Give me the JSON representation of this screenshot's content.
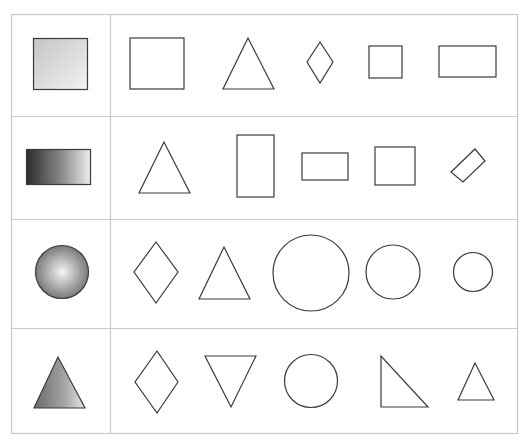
{
  "puzzle": {
    "colors": {
      "grid": "#c8c8c8",
      "stroke": "#333333"
    },
    "rows": [
      {
        "sample": "gradient-square",
        "options": [
          "square",
          "triangle",
          "diamond",
          "small-square",
          "rectangle"
        ]
      },
      {
        "sample": "gradient-rectangle",
        "options": [
          "triangle",
          "tall-rectangle",
          "wide-rectangle",
          "square",
          "rotated-rectangle"
        ]
      },
      {
        "sample": "gradient-circle",
        "options": [
          "diamond",
          "triangle",
          "large-circle",
          "medium-circle",
          "small-circle"
        ]
      },
      {
        "sample": "gradient-triangle",
        "options": [
          "diamond",
          "inverted-triangle",
          "circle",
          "right-triangle",
          "small-triangle"
        ]
      }
    ]
  }
}
